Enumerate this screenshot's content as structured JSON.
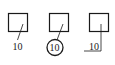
{
  "diagram": {
    "type": "leader-line annotation styles",
    "colors": {
      "line": "#1a1a1a",
      "background": "#ffffff"
    },
    "items": [
      {
        "style": "plain",
        "label": "10"
      },
      {
        "style": "circled",
        "label": "10"
      },
      {
        "style": "underlined",
        "label": "10"
      }
    ]
  }
}
